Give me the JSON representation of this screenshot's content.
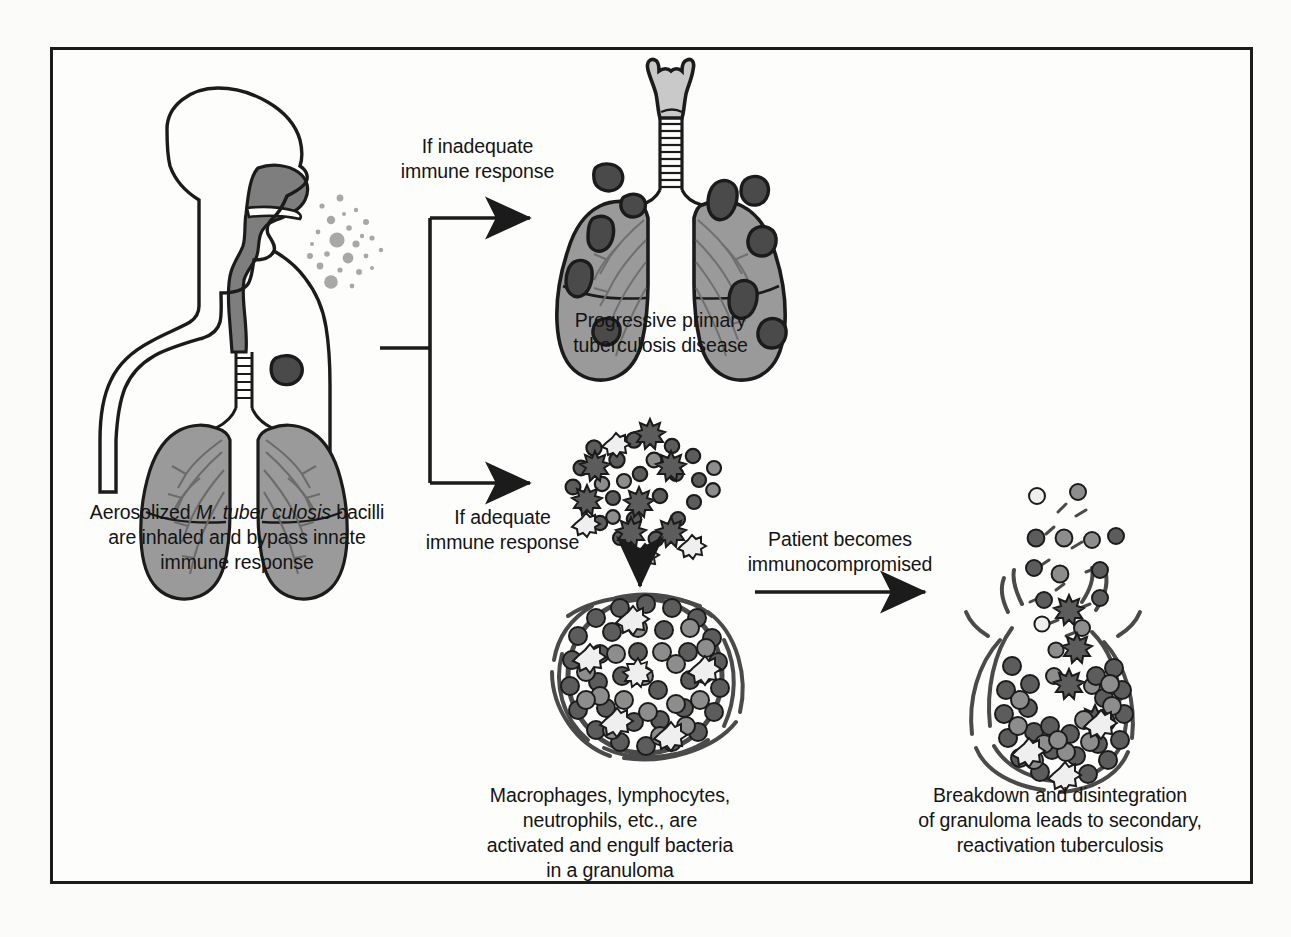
{
  "figure": {
    "border_color": "#1b1b1b",
    "background_color": "#fdfdfc"
  },
  "palette": {
    "outline": "#1b1b1b",
    "tissue_gray": "#9a9a9a",
    "airway_gray": "#7e7e7e",
    "lesion_dark": "#4a4a4a",
    "cell_dark": "#5c5c5c",
    "cell_mid": "#8d8d8d",
    "cell_light": "#efefef",
    "speck_gray": "#a8a8a8"
  },
  "captions": {
    "source": "Aerosolized M. tuber culosis  bacilli\nare inhaled and bypass innate\nimmune response",
    "source_plain_prefix": "Aerosolized ",
    "source_italic": "M. tuber culosis",
    "source_suffix": "  bacilli\nare inhaled and bypass innate\nimmune response",
    "branch_inadequate": "If inadequate\nimmune response",
    "branch_adequate": "If adequate\nimmune response",
    "progressive_disease": "Progressive primary\ntuberculosis disease",
    "immunocompromised": "Patient becomes\nimmunocompromised",
    "granuloma": "Macrophages, lymphocytes,\nneutrophils, etc., are\nactivated and engulf bacteria\nin a granuloma",
    "breakdown": "Breakdown and disintegration\nof granuloma leads to secondary,\nreactivation tuberculosis"
  },
  "illustrations": {
    "head_torso": {
      "name": "human-head-torso-profile",
      "description": "Side profile of head, neck and upper torso with shaded nasopharynx, trachea and two shaded lungs containing bronchial tree; a dark tubercle lesion in the upper right lung"
    },
    "aerosol": {
      "name": "aerosol-droplets",
      "description": "Scattered gray droplets of varying size exiting the mouth",
      "droplet_count": 24
    },
    "diseased_lungs": {
      "name": "diseased-lungs",
      "description": "Anterior view of larynx, ringed trachea and two shaded lungs studded with dark tubercle lesions",
      "lesion_count": 10,
      "tracheal_rings": 11
    },
    "cell_cluster": {
      "name": "immune-cell-cluster",
      "description": "Loose cluster of immune cells: dark lymphocytes, spiked macrophages and pale bacilli",
      "cell_count": 34
    },
    "granuloma": {
      "name": "intact-granuloma",
      "description": "Circular granuloma with fibrous capsule densely packed with immune cells"
    },
    "broken_granuloma": {
      "name": "disintegrating-granuloma",
      "description": "Ruptured granuloma with broken capsule and cells escaping upward"
    }
  },
  "connectors": [
    {
      "name": "branch-connector",
      "type": "bracket",
      "from": "head-torso",
      "to": [
        "diseased-lungs",
        "immune-cell-cluster"
      ]
    },
    {
      "name": "cluster-to-granuloma-arrow",
      "type": "arrow-down",
      "from": "immune-cell-cluster",
      "to": "intact-granuloma"
    },
    {
      "name": "granuloma-to-breakdown-arrow",
      "type": "arrow-right",
      "from": "intact-granuloma",
      "to": "disintegrating-granuloma"
    }
  ]
}
